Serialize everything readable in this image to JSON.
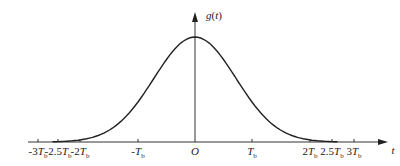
{
  "chart_data": {
    "type": "line",
    "title": "",
    "xlabel": "t",
    "ylabel": "g(t)",
    "origin_label": "O",
    "x_ticks": [
      "-3Tb",
      "-2.5Tb",
      "-2Tb",
      "-Tb",
      "O",
      "Tb",
      "2Tb",
      "2.5Tb",
      "3Tb"
    ],
    "x_tick_values": [
      -3,
      -2.5,
      -2,
      -1,
      0,
      1,
      2,
      2.5,
      3
    ],
    "x_unit": "Tb",
    "xlim": [
      -3,
      3
    ],
    "curve_support": [
      -2.5,
      2.5
    ],
    "x": [
      -2.5,
      -2,
      -1.5,
      -1,
      -0.5,
      0,
      0.5,
      1,
      1.5,
      2,
      2.5
    ],
    "values": [
      0.0,
      0.02,
      0.12,
      0.38,
      0.78,
      1.0,
      0.78,
      0.38,
      0.12,
      0.02,
      0.0
    ],
    "grid": false,
    "legend": null
  },
  "labels": {
    "y_axis": "g(t)",
    "x_axis": "t",
    "origin": "O",
    "ticks": [
      {
        "pre": "-3",
        "sub": "b",
        "x": 38
      },
      {
        "pre": "-2.5",
        "sub": "b",
        "x": 58
      },
      {
        "pre": "-2",
        "sub": "b",
        "x": 80
      },
      {
        "pre": "-",
        "sub": "b",
        "x": 138
      },
      {
        "pre": "",
        "sub": "b",
        "x": 252
      },
      {
        "pre": "2",
        "sub": "b",
        "x": 310
      },
      {
        "pre": "2.5",
        "sub": "b",
        "x": 332
      },
      {
        "pre": "3",
        "sub": "b",
        "x": 354
      }
    ]
  }
}
